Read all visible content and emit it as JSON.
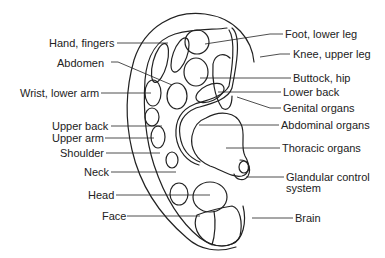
{
  "diagram": {
    "colors": {
      "stroke": "#222222",
      "background": "#ffffff",
      "text": "#222222"
    },
    "labels_left": [
      {
        "id": "hand-fingers",
        "text": "Hand, fingers",
        "x": 49,
        "y": 37
      },
      {
        "id": "abdomen",
        "text": "Abdomen",
        "x": 57,
        "y": 57
      },
      {
        "id": "wrist-lower-arm",
        "text": "Wrist, lower arm",
        "x": 20,
        "y": 87
      },
      {
        "id": "upper-back",
        "text": "Upper back",
        "x": 52,
        "y": 119
      },
      {
        "id": "upper-arm",
        "text": "Upper arm",
        "x": 52,
        "y": 132
      },
      {
        "id": "shoulder",
        "text": "Shoulder",
        "x": 60,
        "y": 147
      },
      {
        "id": "neck",
        "text": "Neck",
        "x": 84,
        "y": 166
      },
      {
        "id": "head",
        "text": "Head",
        "x": 88,
        "y": 189
      },
      {
        "id": "face",
        "text": "Face",
        "x": 102,
        "y": 210
      }
    ],
    "labels_right": [
      {
        "id": "foot-lower-leg",
        "text": "Foot, lower leg",
        "x": 285,
        "y": 28
      },
      {
        "id": "knee-upper-leg",
        "text": "Knee, upper leg",
        "x": 293,
        "y": 48
      },
      {
        "id": "buttock-hip",
        "text": "Buttock, hip",
        "x": 293,
        "y": 72
      },
      {
        "id": "lower-back",
        "text": "Lower back",
        "x": 283,
        "y": 85
      },
      {
        "id": "genital-organs",
        "text": "Genital organs",
        "x": 283,
        "y": 102
      },
      {
        "id": "abdominal-organs",
        "text": "Abdominal organs",
        "x": 281,
        "y": 119
      },
      {
        "id": "thoracic-organs",
        "text": "Thoracic organs",
        "x": 282,
        "y": 142
      },
      {
        "id": "glandular-control-system",
        "text": "Glandular control",
        "text2": "system",
        "x": 286,
        "y": 171
      },
      {
        "id": "brain",
        "text": "Brain",
        "x": 295,
        "y": 212
      }
    ]
  }
}
